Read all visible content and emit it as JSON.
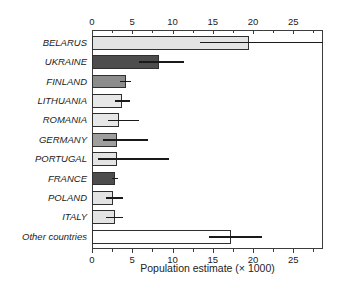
{
  "chart_data": {
    "type": "bar",
    "orientation": "horizontal",
    "title": "",
    "xlabel": "Population estimate (× 1000)",
    "ylabel": "",
    "xlim": [
      0,
      28.7
    ],
    "x_major_ticks": [
      0,
      5,
      10,
      15,
      20,
      25
    ],
    "x_minor_ticks": [
      2.5,
      7.5,
      12.5,
      17.5,
      22.5,
      27.5
    ],
    "axes_style": "box-with-top-and-bottom-ticks",
    "grid": "off",
    "categories": [
      "BELARUS",
      "UKRAINE",
      "FINLAND",
      "LITHUANIA",
      "ROMANIA",
      "GERMANY",
      "PORTUGAL",
      "FRANCE",
      "POLAND",
      "ITALY",
      "Other countries"
    ],
    "values": [
      19.5,
      8.3,
      4.2,
      3.7,
      3.4,
      3.1,
      3.1,
      2.8,
      2.6,
      2.8,
      17.3
    ],
    "error_low": [
      13.4,
      5.8,
      3.5,
      2.8,
      2.0,
      1.3,
      0.8,
      2.5,
      1.7,
      1.7,
      14.5
    ],
    "error_high": [
      28.7,
      11.4,
      4.9,
      4.7,
      5.9,
      6.9,
      9.6,
      3.3,
      3.8,
      3.8,
      21.1
    ],
    "error_note": "Belarus upper error bar is clipped at the right edge of the plot",
    "bar_colors": [
      "#e3e3e3",
      "#4d4d4d",
      "#8c8c8c",
      "#e7e7e7",
      "#e7e7e7",
      "#9e9e9e",
      "#e3e3e3",
      "#4d4d4d",
      "#e3e3e3",
      "#e3e3e3",
      "#ffffff"
    ],
    "bar_border_color": "#2f2f2f",
    "error_bar_color": "#1a1a1a",
    "axis_color": "#3c3c3c",
    "text_color": "#222222",
    "background_color": "#ffffff"
  }
}
